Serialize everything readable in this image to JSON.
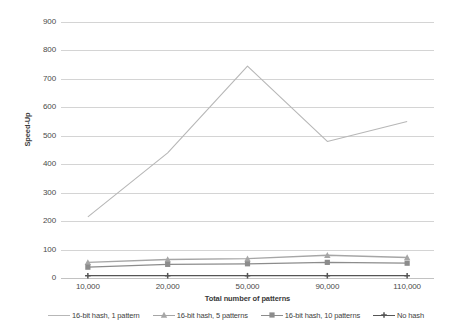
{
  "chart_data": {
    "type": "line",
    "title": "",
    "subtitle": "",
    "xlabel": "Total number of patterns",
    "ylabel": "Speed-Up",
    "categories": [
      "10,000",
      "20,000",
      "50,000",
      "90,000",
      "110,000"
    ],
    "ylim": [
      0,
      900
    ],
    "ytick_labels": [
      "0",
      "100",
      "200",
      "300",
      "400",
      "500",
      "600",
      "700",
      "800",
      "900"
    ],
    "ytick_values": [
      0,
      100,
      200,
      300,
      400,
      500,
      600,
      700,
      800,
      900
    ],
    "grid": "horizontal",
    "legend_position": "bottom",
    "series": [
      {
        "name": "16-bit hash, 1 pattern",
        "values": [
          215,
          440,
          745,
          480,
          550
        ],
        "color": "#b7b7b7",
        "marker": "none"
      },
      {
        "name": "16-bit hash, 5 patterns",
        "values": [
          55,
          65,
          68,
          80,
          72
        ],
        "color": "#a6a6a6",
        "marker": "triangle"
      },
      {
        "name": "16-bit hash, 10 patterns",
        "values": [
          38,
          48,
          50,
          55,
          52
        ],
        "color": "#8c8c8c",
        "marker": "square"
      },
      {
        "name": "No hash",
        "values": [
          8,
          8,
          8,
          8,
          8
        ],
        "color": "#555555",
        "marker": "cross"
      }
    ]
  },
  "axes": {
    "y_title": "Speed-Up",
    "x_title": "Total number of patterns"
  },
  "colors": {
    "gridline": "#d4d4d4",
    "text": "#4a4a4a",
    "background": "#ffffff"
  }
}
